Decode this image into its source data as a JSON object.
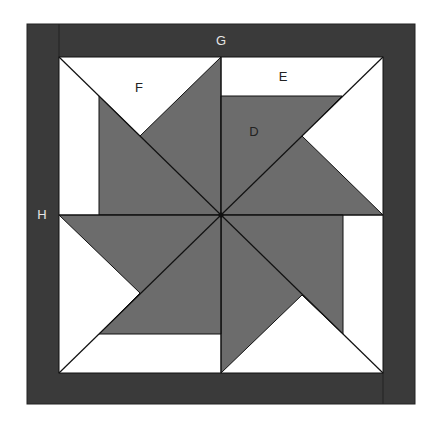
{
  "diagram": {
    "type": "quilt-block-pinwheel",
    "labels": {
      "D": "D",
      "E": "E",
      "F": "F",
      "G": "G",
      "H": "H"
    },
    "colors": {
      "border": "#3a3a3a",
      "blade": "#6c6c6c",
      "background": "#ffffff",
      "line": "#111111",
      "border_text": "#e6e6e6",
      "inner_text": "#222222"
    }
  }
}
